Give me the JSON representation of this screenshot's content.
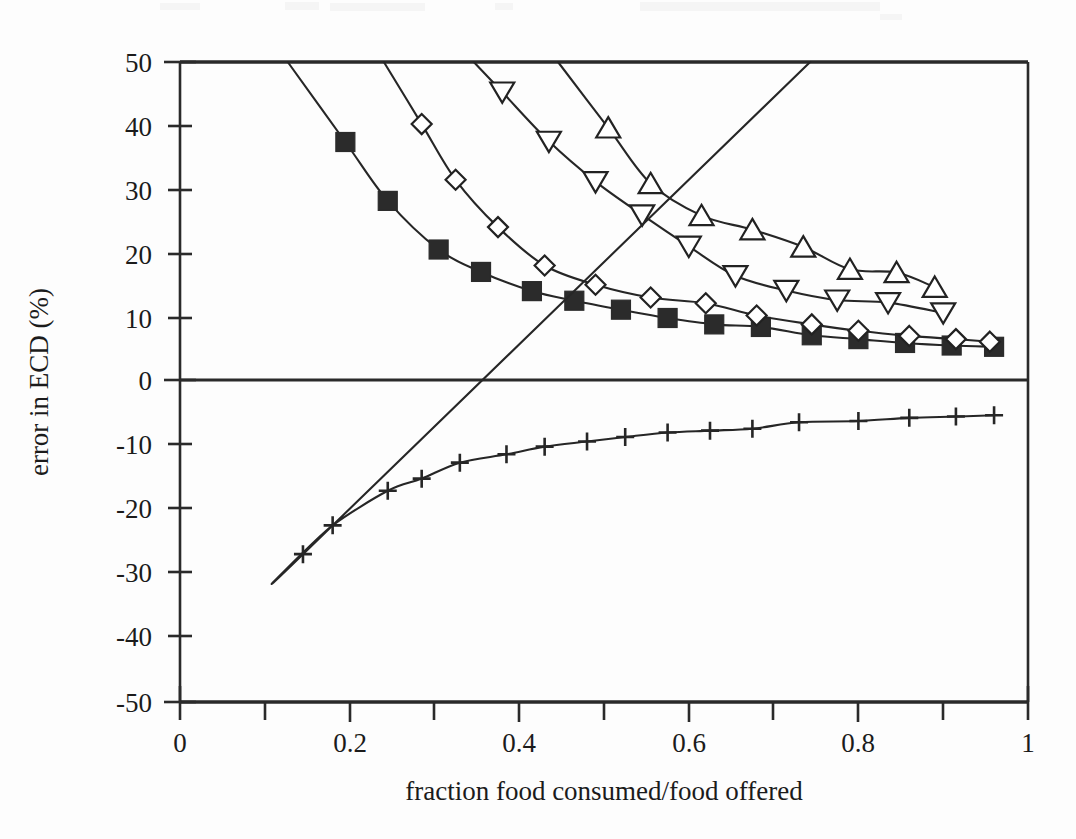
{
  "chart_data": {
    "type": "line",
    "title": "",
    "subtitle": "",
    "xlabel": "fraction food consumed/food offered",
    "ylabel": "error in ECD (%)",
    "xlim": [
      0,
      1
    ],
    "ylim": [
      -50,
      50
    ],
    "xticks": [
      0,
      0.2,
      0.4,
      0.6,
      0.8,
      1
    ],
    "xticklabels": [
      "0",
      "0.2",
      "0.4",
      "0.6",
      "0.8",
      "1"
    ],
    "xminorticks": [
      0.1,
      0.3,
      0.5,
      0.7,
      0.9
    ],
    "yticks": [
      50,
      40,
      30,
      20,
      10,
      0,
      -10,
      -20,
      -30,
      -40,
      -50
    ],
    "yticklabels": [
      "50",
      "40",
      "30",
      "20",
      "10",
      "0",
      "-10",
      "-20",
      "-30",
      "-40",
      "-50"
    ],
    "grid": false,
    "legend": "none",
    "zero_line": true,
    "annotations": [],
    "series": [
      {
        "name": "filled-square-series",
        "marker": "filled-square",
        "marker_style": "filled",
        "color": "#2b2b2b",
        "x": [
          0.195,
          0.245,
          0.305,
          0.355,
          0.415,
          0.465,
          0.52,
          0.575,
          0.63,
          0.685,
          0.745,
          0.8,
          0.855,
          0.91,
          0.96
        ],
        "y": [
          37.5,
          28.3,
          20.7,
          17.2,
          14.2,
          12.7,
          11.3,
          10.0,
          9.0,
          8.6,
          7.3,
          6.7,
          6.1,
          5.7,
          5.5
        ]
      },
      {
        "name": "open-diamond-series",
        "marker": "open-diamond",
        "marker_style": "open",
        "color": "#222222",
        "x": [
          0.285,
          0.325,
          0.375,
          0.43,
          0.49,
          0.555,
          0.62,
          0.68,
          0.745,
          0.8,
          0.86,
          0.915,
          0.955
        ],
        "y": [
          40.3,
          31.6,
          24.2,
          18.2,
          15.2,
          13.2,
          12.3,
          10.4,
          9.0,
          8.0,
          7.2,
          6.7,
          6.3
        ]
      },
      {
        "name": "open-down-triangle-series",
        "marker": "open-down-triangle",
        "marker_style": "open",
        "color": "#222222",
        "x": [
          0.38,
          0.435,
          0.49,
          0.545,
          0.6,
          0.655,
          0.715,
          0.775,
          0.835,
          0.9
        ],
        "y": [
          45.3,
          37.6,
          31.3,
          26.1,
          21.2,
          16.6,
          14.3,
          12.8,
          12.4,
          10.8
        ]
      },
      {
        "name": "open-up-triangle-series",
        "marker": "open-up-triangle",
        "marker_style": "open",
        "color": "#222222",
        "x": [
          0.505,
          0.555,
          0.615,
          0.675,
          0.735,
          0.79,
          0.845,
          0.89
        ],
        "y": [
          39.7,
          31.0,
          26.0,
          23.8,
          21.1,
          17.6,
          17.1,
          14.8
        ]
      },
      {
        "name": "plus-series",
        "marker": "plus",
        "marker_style": "plus",
        "color": "#262626",
        "x": [
          0.145,
          0.18,
          0.245,
          0.285,
          0.33,
          0.385,
          0.43,
          0.48,
          0.525,
          0.575,
          0.625,
          0.675,
          0.73,
          0.8,
          0.86,
          0.915,
          0.96
        ],
        "y": [
          -26.9,
          -22.4,
          -17.0,
          -15.1,
          -12.6,
          -11.3,
          -10.1,
          -9.3,
          -8.6,
          -7.9,
          -7.6,
          -7.3,
          -6.3,
          -6.1,
          -5.6,
          -5.4,
          -5.2
        ]
      }
    ]
  },
  "axes": {
    "x_title": "fraction food consumed/food offered",
    "y_title": "error in ECD (%)"
  }
}
